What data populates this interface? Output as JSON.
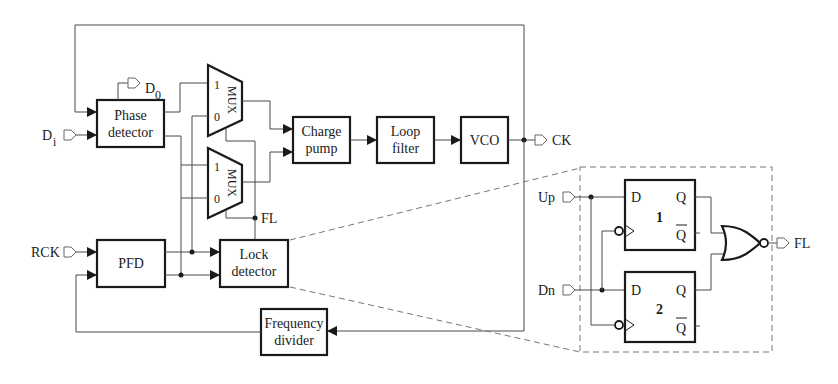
{
  "diagram": {
    "type": "block-diagram",
    "inputs": {
      "di": {
        "label": "D",
        "sub": "i"
      },
      "rck": {
        "label": "RCK"
      }
    },
    "outputs": {
      "do": {
        "label": "D",
        "sub": "0"
      },
      "ck": {
        "label": "CK"
      },
      "fl_node": {
        "label": "FL"
      }
    },
    "blocks": {
      "phase_detector": {
        "line1": "Phase",
        "line2": "detector"
      },
      "mux1": {
        "label": "MUX",
        "in1": "1",
        "in0": "0"
      },
      "mux2": {
        "label": "MUX",
        "in1": "1",
        "in0": "0"
      },
      "charge_pump": {
        "line1": "Charge",
        "line2": "pump"
      },
      "loop_filter": {
        "line1": "Loop",
        "line2": "filter"
      },
      "vco": {
        "line1": "VCO"
      },
      "pfd": {
        "line1": "PFD"
      },
      "lock_detector": {
        "line1": "Lock",
        "line2": "detector"
      },
      "freq_divider": {
        "line1": "Frequency",
        "line2": "divider"
      }
    },
    "detail": {
      "inputs": {
        "up": "Up",
        "dn": "Dn"
      },
      "ff1": {
        "d": "D",
        "q": "Q",
        "qbar": "Q",
        "num": "1"
      },
      "ff2": {
        "d": "D",
        "q": "Q",
        "qbar": "Q",
        "num": "2"
      },
      "gate": "NOR",
      "output": "FL"
    }
  }
}
